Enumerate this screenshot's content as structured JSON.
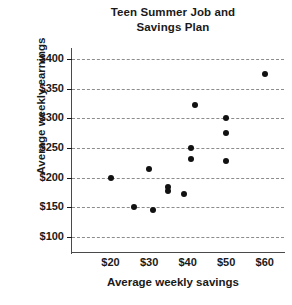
{
  "chart_data": {
    "type": "scatter",
    "title": "Teen Summer Job and Savings Plan",
    "title_lines": [
      "Teen Summer Job and",
      "Savings Plan"
    ],
    "xlabel": "Average weekly savings",
    "ylabel": "Average weekly earnings",
    "xlim": [
      10,
      65
    ],
    "ylim": [
      75,
      412
    ],
    "grid": true,
    "grid_axis": "y",
    "legend": null,
    "x_ticks": [
      20,
      30,
      40,
      50,
      60
    ],
    "x_tick_labels": [
      "$20",
      "$30",
      "$40",
      "$50",
      "$60"
    ],
    "y_ticks": [
      100,
      150,
      200,
      250,
      300,
      350,
      400
    ],
    "y_tick_labels": [
      "$100",
      "$150",
      "$200",
      "$250",
      "$300",
      "$350",
      "$400"
    ],
    "points": [
      {
        "x": 20,
        "y": 200
      },
      {
        "x": 26,
        "y": 150
      },
      {
        "x": 30,
        "y": 215
      },
      {
        "x": 31,
        "y": 145
      },
      {
        "x": 35,
        "y": 185
      },
      {
        "x": 35,
        "y": 178
      },
      {
        "x": 39,
        "y": 172
      },
      {
        "x": 41,
        "y": 250
      },
      {
        "x": 41,
        "y": 232
      },
      {
        "x": 42,
        "y": 322
      },
      {
        "x": 50,
        "y": 300
      },
      {
        "x": 50,
        "y": 275
      },
      {
        "x": 50,
        "y": 228
      },
      {
        "x": 60,
        "y": 375
      }
    ]
  }
}
